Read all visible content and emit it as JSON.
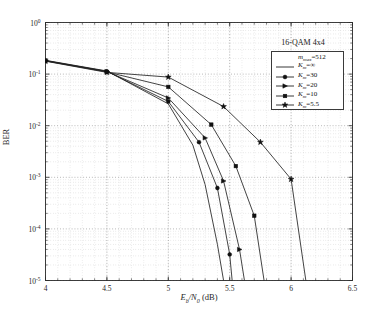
{
  "chart_data": {
    "type": "line",
    "title": "16-QAM 4x4",
    "xlabel": "Eb/N0 (dB)",
    "ylabel": "BER",
    "xlim": [
      4,
      6.5
    ],
    "ylim": [
      1e-05,
      1
    ],
    "yscale": "log",
    "grid": true,
    "xticks": [
      4,
      4.5,
      5,
      5.5,
      6,
      6.5
    ],
    "xticklabels": [
      "4",
      "4.5",
      "5",
      "5.5",
      "6",
      "6.5"
    ],
    "yticks": [
      1,
      0.1,
      0.01,
      0.001,
      0.0001,
      1e-05
    ],
    "yticklabels": [
      "10^0",
      "10^-1",
      "10^-2",
      "10^-3",
      "10^-4",
      "10^-5"
    ],
    "legend_position": "upper right",
    "legend_header": "m_max=512",
    "series": [
      {
        "name": "K_m=∞",
        "marker": "none",
        "x": [
          4,
          4.5,
          5,
          5.2,
          5.3,
          5.4,
          5.45
        ],
        "y": [
          0.185,
          0.115,
          0.0265,
          0.0042,
          0.00072,
          5e-05,
          1e-05
        ]
      },
      {
        "name": "K_m=30",
        "marker": "circle",
        "x": [
          4,
          4.5,
          5,
          5.25,
          5.4,
          5.5,
          5.52
        ],
        "y": [
          0.183,
          0.113,
          0.0295,
          0.0048,
          0.00062,
          3.2e-05,
          1e-05
        ]
      },
      {
        "name": "K_m=20",
        "marker": "triangle-right",
        "x": [
          4,
          4.5,
          5,
          5.3,
          5.45,
          5.58,
          5.62
        ],
        "y": [
          0.181,
          0.112,
          0.0345,
          0.0058,
          0.00085,
          4e-05,
          1e-05
        ]
      },
      {
        "name": "K_m=10",
        "marker": "square",
        "x": [
          4,
          4.5,
          5,
          5.35,
          5.55,
          5.7,
          5.78
        ],
        "y": [
          0.18,
          0.11,
          0.0565,
          0.0105,
          0.00165,
          0.00018,
          1e-05
        ]
      },
      {
        "name": "K_m=5.5",
        "marker": "star",
        "x": [
          4,
          4.5,
          5,
          5.45,
          5.75,
          6.0,
          6.12
        ],
        "y": [
          0.178,
          0.108,
          0.0875,
          0.0235,
          0.0048,
          0.00092,
          1e-05
        ]
      }
    ]
  },
  "axes": {
    "ylabel_text": "BER"
  }
}
